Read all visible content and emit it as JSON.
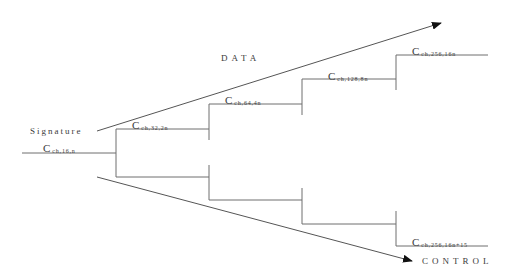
{
  "diagram": {
    "type": "binary-tree",
    "root": {
      "title": "Signature",
      "label_main": "C",
      "label_sub": "ch,16,n"
    },
    "nodes": [
      {
        "label_main": "C",
        "label_sub": "ch,32,2n"
      },
      {
        "label_main": "C",
        "label_sub": "ch,64,4n"
      },
      {
        "label_main": "C",
        "label_sub": "ch,128,8n"
      },
      {
        "label_main": "C",
        "label_sub": "ch,256,16n"
      },
      {
        "label_main": "C",
        "label_sub": "ch,256,16n+15"
      }
    ],
    "arrows": {
      "data": "DATA",
      "control": "CONTROL"
    },
    "colors": {
      "line": "#6e6e6e",
      "arrow": "#555555",
      "arrowhead": "#111111",
      "text": "#3a3a3a"
    }
  }
}
